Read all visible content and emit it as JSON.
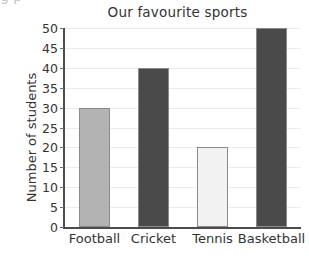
{
  "chart_data": {
    "type": "bar",
    "title": "Our favourite sports",
    "xlabel": "",
    "ylabel": "Number of students",
    "categories": [
      "Football",
      "Cricket",
      "Tennis",
      "Basketball"
    ],
    "values": [
      30,
      40,
      20,
      50
    ],
    "series": [
      {
        "name": "Number of students",
        "values": [
          30,
          40,
          20,
          50
        ]
      }
    ],
    "bar_colors": [
      "#b3b3b3",
      "#4a4a4a",
      "#f2f2f2",
      "#4a4a4a"
    ],
    "bar_edge_color": "#8a8a8a",
    "ylim": [
      0,
      50
    ],
    "ytick_step": 5,
    "yticks": [
      0,
      5,
      10,
      15,
      20,
      25,
      30,
      35,
      40,
      45,
      50
    ],
    "ytick_labels": [
      "0",
      "5",
      "10",
      "15",
      "20",
      "25",
      "30",
      "35",
      "40",
      "45",
      "50"
    ],
    "grid": true,
    "grid_axis": "y",
    "grid_color": "#ededed",
    "legend": false,
    "legend_position": "none",
    "axis_color": "#4c4c4c",
    "background": "#ffffff"
  },
  "figure": {
    "title": "Our favourite sports",
    "y_axis_title": "Number of students",
    "scan_artifact_text": "g   p"
  }
}
